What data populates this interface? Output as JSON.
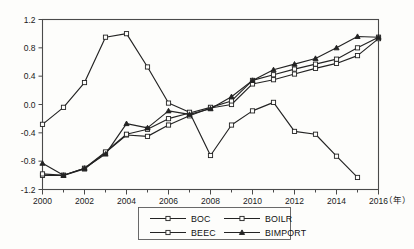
{
  "chart_data": {
    "type": "line",
    "title": "",
    "xlabel": "（年）",
    "ylabel": "",
    "xlim": [
      2000,
      2016
    ],
    "ylim": [
      -1.2,
      1.2
    ],
    "grid": false,
    "legend_position": "bottom-center",
    "x": [
      2000,
      2001,
      2002,
      2003,
      2004,
      2005,
      2006,
      2007,
      2008,
      2009,
      2010,
      2011,
      2012,
      2013,
      2014,
      2015,
      2016
    ],
    "xticks": [
      "2000",
      "2002",
      "2004",
      "2006",
      "2008",
      "2010",
      "2012",
      "2014",
      "2016"
    ],
    "yticks": [
      "1.2",
      "0.8",
      "0.4",
      "0.0",
      "-0.4",
      "-0.8",
      "-1.2"
    ],
    "series": [
      {
        "name": "BOC",
        "marker": "open-square",
        "values": [
          -1.0,
          -1.0,
          -0.91,
          -0.68,
          -0.43,
          -0.45,
          -0.29,
          -0.16,
          -0.05,
          0.0,
          0.29,
          0.35,
          0.43,
          0.51,
          0.58,
          0.69,
          0.93
        ]
      },
      {
        "name": "BOILR",
        "marker": "open-square",
        "values": [
          -0.98,
          -1.0,
          -0.9,
          -0.67,
          -0.42,
          -0.35,
          -0.2,
          -0.12,
          -0.04,
          0.05,
          0.34,
          0.42,
          0.5,
          0.57,
          0.64,
          0.8,
          0.95
        ]
      },
      {
        "name": "BEEC",
        "marker": "open-square",
        "values": [
          -0.28,
          -0.04,
          0.31,
          0.95,
          1.0,
          0.53,
          0.02,
          -0.11,
          -0.72,
          -0.29,
          -0.09,
          0.03,
          -0.38,
          -0.42,
          -0.73,
          -1.03,
          null
        ]
      },
      {
        "name": "BIMPORT",
        "marker": "solid-triangle",
        "values": [
          -0.83,
          -1.0,
          -0.9,
          -0.7,
          -0.27,
          -0.33,
          -0.09,
          -0.14,
          -0.06,
          0.11,
          0.34,
          0.49,
          0.57,
          0.65,
          0.8,
          0.96,
          0.95
        ]
      }
    ],
    "legend_entries": [
      {
        "label": "BOC",
        "marker": "open-square"
      },
      {
        "label": "BOILR",
        "marker": "open-square"
      },
      {
        "label": "BEEC",
        "marker": "open-square"
      },
      {
        "label": "BIMPORT",
        "marker": "solid-triangle"
      }
    ]
  }
}
